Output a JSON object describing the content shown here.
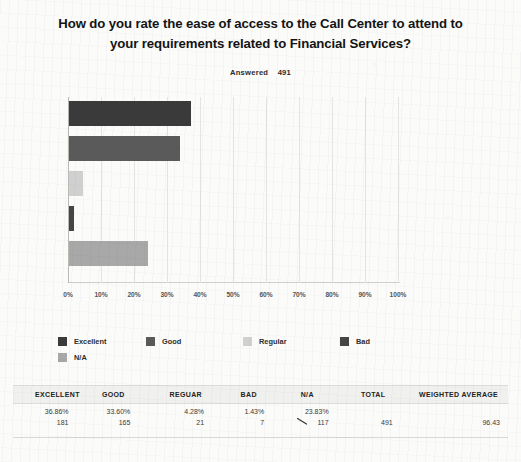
{
  "survey": {
    "question": "How do you rate the ease of access to the Call Center to attend to your requirements related to Financial Services?",
    "answered_label": "Answered",
    "answered_count": "491"
  },
  "chart_data": {
    "type": "bar",
    "orientation": "horizontal",
    "title": "How do you rate the ease of access to the Call Center to attend to your requirements related to Financial Services?",
    "categories": [
      "Excellent",
      "Good",
      "Regular",
      "Bad",
      "N/A"
    ],
    "values": [
      36.86,
      33.6,
      4.28,
      1.43,
      23.83
    ],
    "counts": [
      181,
      165,
      21,
      7,
      117
    ],
    "xlabel": "",
    "ylabel": "",
    "xlim": [
      0,
      100
    ],
    "xticks": [
      "0%",
      "10%",
      "20%",
      "30%",
      "40%",
      "50%",
      "60%",
      "70%",
      "80%",
      "90%",
      "100%"
    ],
    "grid": true,
    "legend_position": "below",
    "colors": [
      "#3a3a3a",
      "#5a5a5a",
      "#d0d0d0",
      "#464646",
      "#a8a8a8"
    ],
    "total": 491,
    "weighted_average": 96.43
  },
  "legend": {
    "items": [
      {
        "label": "Excellent",
        "color": "#3a3a3a"
      },
      {
        "label": "Good",
        "color": "#5a5a5a"
      },
      {
        "label": "Regular",
        "color": "#d0d0d0"
      },
      {
        "label": "Bad",
        "color": "#464646"
      },
      {
        "label": "N/A",
        "color": "#a8a8a8"
      }
    ]
  },
  "table": {
    "headers": [
      "EXCELLENT",
      "GOOD",
      "REGUAR",
      "BAD",
      "N/A",
      "TOTAL",
      "WEIGHTED AVERAGE"
    ],
    "row": {
      "excellent_pct": "36.86%",
      "excellent_count": "181",
      "good_pct": "33.60%",
      "good_count": "165",
      "regular_pct": "4.28%",
      "regular_count": "21",
      "bad_pct": "1.43%",
      "bad_count": "7",
      "na_pct": "23.83%",
      "na_count": "117",
      "total": "491",
      "weighted_average": "96.43"
    }
  }
}
